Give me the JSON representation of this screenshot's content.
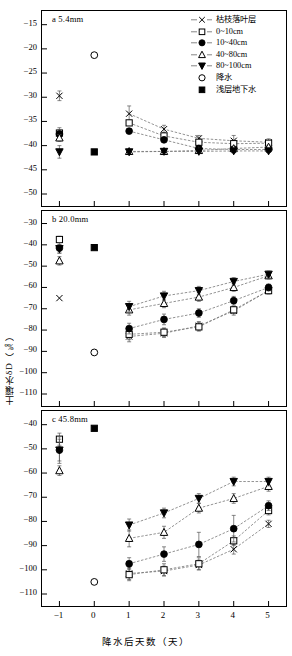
{
  "figure": {
    "axis_x_title": "降水后天数（天）",
    "axis_y_title": "土壤水δD（‰）",
    "x_ticks": [
      "-1",
      "0",
      "1",
      "2",
      "3",
      "4",
      "5"
    ]
  },
  "legend": {
    "items": [
      {
        "label": "枯枝落叶层",
        "marker": "cross-marker",
        "line": true
      },
      {
        "label": "0~10cm",
        "marker": "open-square-marker",
        "line": true
      },
      {
        "label": "10~40cm",
        "marker": "filled-circle-marker",
        "line": true
      },
      {
        "label": "40~80cm",
        "marker": "open-triangle-marker",
        "line": true
      },
      {
        "label": "80~100cm",
        "marker": "filled-triangle-down-marker",
        "line": true
      },
      {
        "label": "降水",
        "marker": "open-circle-marker",
        "line": false
      },
      {
        "label": "浅层地下水",
        "marker": "filled-square-marker",
        "line": false
      }
    ]
  },
  "panels": {
    "a": {
      "label": "a  5.4mm",
      "y_ticks": [
        "-15",
        "-20",
        "-25",
        "-30",
        "-35",
        "-40",
        "-45",
        "-50"
      ]
    },
    "b": {
      "label": "b  20.0mm",
      "y_ticks": [
        "-30",
        "-40",
        "-50",
        "-60",
        "-70",
        "-80",
        "-90",
        "-100",
        "-110"
      ]
    },
    "c": {
      "label": "c  45.8mm",
      "y_ticks": [
        "-40",
        "-50",
        "-60",
        "-70",
        "-80",
        "-90",
        "-100",
        "-110"
      ]
    }
  },
  "chart_data": [
    {
      "id": "panel-a",
      "type": "line",
      "title": "a  5.4mm",
      "xlabel": "降水后天数（天）",
      "ylabel": "土壤水δD（‰）",
      "xlim": [
        -1.5,
        5.5
      ],
      "ylim": [
        -50,
        -13
      ],
      "yticks": [
        -15,
        -20,
        -25,
        -30,
        -35,
        -40,
        -45,
        -50
      ],
      "xticks": [
        -1,
        0,
        1,
        2,
        3,
        4,
        5
      ],
      "grid": false,
      "legend_position": "top-right",
      "series": [
        {
          "name": "枯枝落叶层",
          "marker": "cross",
          "x": [
            -1,
            1,
            2,
            3,
            4,
            5
          ],
          "values": [
            -29.7,
            -33.4,
            -36.6,
            -38.5,
            -39.0,
            -39.3
          ],
          "errors": [
            1.0,
            1.6,
            0.8,
            0.6,
            1.1,
            0.7
          ]
        },
        {
          "name": "0~10cm",
          "marker": "open-square",
          "x": [
            -1,
            1,
            2,
            3,
            4,
            5
          ],
          "values": [
            -37.4,
            -35.3,
            -38.0,
            -39.3,
            -39.6,
            -39.5
          ],
          "errors": [
            1.1,
            0.5,
            0.6,
            0.5,
            0.7,
            0.5
          ]
        },
        {
          "name": "10~40cm",
          "marker": "filled-circle",
          "x": [
            -1,
            1,
            2,
            3,
            4,
            5
          ],
          "values": [
            -37.6,
            -37.0,
            -38.8,
            -40.6,
            -40.8,
            -40.8
          ],
          "errors": [
            0.9,
            0.5,
            0.5,
            0.5,
            0.6,
            0.4
          ]
        },
        {
          "name": "40~80cm",
          "marker": "open-triangle",
          "x": [
            -1,
            1,
            2,
            3,
            4,
            5
          ],
          "values": [
            -38.4,
            -41.2,
            -41.2,
            -41.0,
            -40.6,
            -40.3
          ],
          "errors": [
            0.7,
            0.4,
            0.4,
            0.4,
            0.5,
            0.4
          ]
        },
        {
          "name": "80~100cm",
          "marker": "filled-triangle-down",
          "x": [
            -1,
            1,
            2,
            3,
            4,
            5
          ],
          "values": [
            -41.3,
            -41.3,
            -41.2,
            -41.2,
            -41.1,
            -41.1
          ],
          "errors": [
            1.3,
            0.3,
            0.3,
            0.3,
            0.4,
            0.3
          ]
        },
        {
          "name": "降水",
          "marker": "open-circle",
          "x": [
            0
          ],
          "values": [
            -21.3
          ],
          "errors": [
            0
          ]
        },
        {
          "name": "浅层地下水",
          "marker": "filled-square",
          "x": [
            0
          ],
          "values": [
            -41.3
          ],
          "errors": [
            0
          ]
        }
      ]
    },
    {
      "id": "panel-b",
      "type": "line",
      "title": "b  20.0mm",
      "xlabel": "降水后天数（天）",
      "ylabel": "土壤水δD（‰）",
      "xlim": [
        -1.5,
        5.5
      ],
      "ylim": [
        -110,
        -26
      ],
      "yticks": [
        -30,
        -40,
        -50,
        -60,
        -70,
        -80,
        -90,
        -100,
        -110
      ],
      "xticks": [
        -1,
        0,
        1,
        2,
        3,
        4,
        5
      ],
      "grid": false,
      "legend_position": "none",
      "series": [
        {
          "name": "枯枝落叶层",
          "marker": "cross",
          "x": [
            -1,
            1,
            2,
            3,
            4,
            5
          ],
          "values": [
            -65.0,
            -83.0,
            -81.5,
            -78.0,
            -71.0,
            -61.5
          ],
          "errors": [
            0,
            2.5,
            2.0,
            2.0,
            2.0,
            1.5
          ]
        },
        {
          "name": "0~10cm",
          "marker": "open-square",
          "x": [
            -1,
            1,
            2,
            3,
            4,
            5
          ],
          "values": [
            -37.5,
            -82.0,
            -81.0,
            -78.5,
            -70.5,
            -61.5
          ],
          "errors": [
            1.5,
            2.5,
            2.0,
            2.0,
            1.8,
            1.5
          ]
        },
        {
          "name": "10~40cm",
          "marker": "filled-circle",
          "x": [
            -1,
            1,
            2,
            3,
            4,
            5
          ],
          "values": [
            -41.5,
            -79.3,
            -75.0,
            -72.0,
            -66.2,
            -60.0
          ],
          "errors": [
            2.5,
            2.5,
            2.5,
            2.0,
            2.0,
            1.6
          ]
        },
        {
          "name": "40~80cm",
          "marker": "open-triangle",
          "x": [
            -1,
            1,
            2,
            3,
            4,
            5
          ],
          "values": [
            -47.5,
            -70.5,
            -67.5,
            -64.5,
            -60.0,
            -54.5
          ],
          "errors": [
            2.0,
            2.5,
            2.0,
            2.0,
            1.8,
            1.5
          ]
        },
        {
          "name": "80~100cm",
          "marker": "filled-triangle-down",
          "x": [
            -1,
            1,
            2,
            3,
            4,
            5
          ],
          "values": [
            -41.8,
            -69.0,
            -64.0,
            -61.5,
            -57.2,
            -53.8
          ],
          "errors": [
            2.0,
            2.5,
            2.2,
            2.0,
            1.8,
            1.5
          ]
        },
        {
          "name": "降水",
          "marker": "open-circle",
          "x": [
            0
          ],
          "values": [
            -90.5
          ],
          "errors": [
            0
          ]
        },
        {
          "name": "浅层地下水",
          "marker": "filled-square",
          "x": [
            0
          ],
          "values": [
            -41.3
          ],
          "errors": [
            0
          ]
        }
      ]
    },
    {
      "id": "panel-c",
      "type": "line",
      "title": "c  45.8mm",
      "xlabel": "降水后天数（天）",
      "ylabel": "土壤水δD（‰）",
      "xlim": [
        -1.5,
        5.5
      ],
      "ylim": [
        -110,
        -36
      ],
      "yticks": [
        -40,
        -50,
        -60,
        -70,
        -80,
        -90,
        -100,
        -110
      ],
      "xticks": [
        -1,
        0,
        1,
        2,
        3,
        4,
        5
      ],
      "grid": false,
      "legend_position": "none",
      "series": [
        {
          "name": "枯枝落叶层",
          "marker": "cross",
          "x": [
            -1,
            1,
            2,
            3,
            4,
            5
          ],
          "values": [
            null,
            -101.5,
            -100.5,
            -98.0,
            -91.5,
            -81.0
          ],
          "errors": [
            0,
            2.5,
            2.0,
            2.0,
            2.0,
            1.5
          ]
        },
        {
          "name": "0~10cm",
          "marker": "open-square",
          "x": [
            -1,
            1,
            2,
            3,
            4,
            5
          ],
          "values": [
            -46.0,
            -102.0,
            -100.0,
            -97.5,
            -88.0,
            -75.5
          ],
          "errors": [
            2.5,
            2.5,
            2.5,
            2.5,
            2.0,
            1.8
          ]
        },
        {
          "name": "10~40cm",
          "marker": "filled-circle",
          "x": [
            -1,
            1,
            2,
            3,
            4,
            5
          ],
          "values": [
            -50.5,
            -97.5,
            -93.5,
            -89.5,
            -83.0,
            -73.5
          ],
          "errors": [
            4.5,
            2.5,
            3.0,
            5.0,
            5.5,
            2.0
          ]
        },
        {
          "name": "40~80cm",
          "marker": "open-triangle",
          "x": [
            -1,
            1,
            2,
            3,
            4,
            5
          ],
          "values": [
            -59.0,
            -87.0,
            -84.5,
            -74.5,
            -70.5,
            -65.5
          ],
          "errors": [
            2.0,
            3.5,
            2.5,
            2.0,
            2.0,
            2.0
          ]
        },
        {
          "name": "80~100cm",
          "marker": "filled-triangle-down",
          "x": [
            -1,
            1,
            2,
            3,
            4,
            5
          ],
          "values": [
            -50.5,
            -81.5,
            -76.5,
            -70.5,
            -63.5,
            -63.5
          ],
          "errors": [
            5.5,
            2.5,
            2.0,
            2.0,
            1.8,
            1.8
          ]
        },
        {
          "name": "降水",
          "marker": "open-circle",
          "x": [
            0
          ],
          "values": [
            -105.0
          ],
          "errors": [
            0
          ]
        },
        {
          "name": "浅层地下水",
          "marker": "filled-square",
          "x": [
            0
          ],
          "values": [
            -41.5
          ],
          "errors": [
            0
          ]
        }
      ]
    }
  ]
}
